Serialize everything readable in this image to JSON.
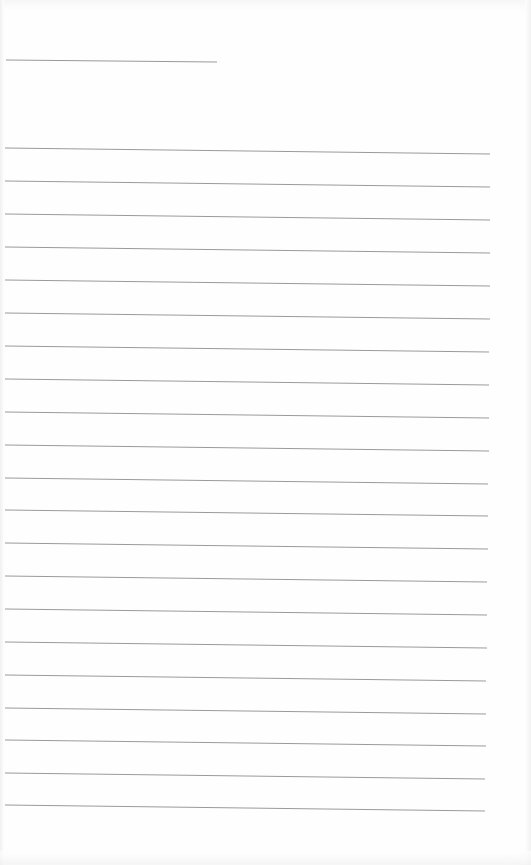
{
  "page": {
    "type": "blank lined notebook page",
    "background_color": "#fefefe",
    "line_color": "#9a9a9a"
  },
  "header_line": {
    "x1": 6,
    "y1": 60,
    "x2": 217,
    "y2": 62
  },
  "ruled_lines": [
    {
      "x1": 5,
      "y1": 148,
      "x2": 490,
      "y2": 154
    },
    {
      "x1": 5,
      "y1": 181,
      "x2": 490,
      "y2": 187
    },
    {
      "x1": 5,
      "y1": 214,
      "x2": 490,
      "y2": 220
    },
    {
      "x1": 5,
      "y1": 247,
      "x2": 490,
      "y2": 253
    },
    {
      "x1": 5,
      "y1": 280,
      "x2": 490,
      "y2": 286
    },
    {
      "x1": 5,
      "y1": 313,
      "x2": 490,
      "y2": 319
    },
    {
      "x1": 5,
      "y1": 346,
      "x2": 489,
      "y2": 352
    },
    {
      "x1": 5,
      "y1": 379,
      "x2": 489,
      "y2": 385
    },
    {
      "x1": 5,
      "y1": 412,
      "x2": 489,
      "y2": 418
    },
    {
      "x1": 5,
      "y1": 445,
      "x2": 489,
      "y2": 451
    },
    {
      "x1": 5,
      "y1": 478,
      "x2": 488,
      "y2": 484
    },
    {
      "x1": 5,
      "y1": 510,
      "x2": 488,
      "y2": 516
    },
    {
      "x1": 5,
      "y1": 543,
      "x2": 488,
      "y2": 549
    },
    {
      "x1": 5,
      "y1": 576,
      "x2": 487,
      "y2": 582
    },
    {
      "x1": 5,
      "y1": 609,
      "x2": 487,
      "y2": 615
    },
    {
      "x1": 5,
      "y1": 642,
      "x2": 487,
      "y2": 648
    },
    {
      "x1": 5,
      "y1": 675,
      "x2": 486,
      "y2": 681
    },
    {
      "x1": 5,
      "y1": 708,
      "x2": 486,
      "y2": 714
    },
    {
      "x1": 5,
      "y1": 740,
      "x2": 486,
      "y2": 746
    },
    {
      "x1": 5,
      "y1": 773,
      "x2": 485,
      "y2": 779
    },
    {
      "x1": 5,
      "y1": 805,
      "x2": 485,
      "y2": 811
    }
  ]
}
